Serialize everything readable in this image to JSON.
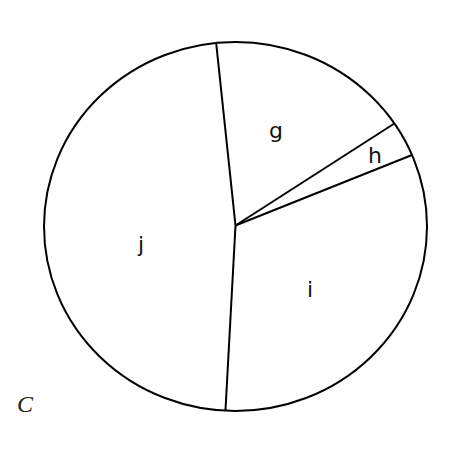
{
  "panel_label": "C",
  "chart_data": {
    "type": "pie",
    "title": "",
    "categories": [
      "g",
      "h",
      "i",
      "j"
    ],
    "values": [
      17.2,
      3.1,
      32.2,
      47.6
    ],
    "start_angle_deg": 354.2,
    "direction": "clockwise",
    "legend": "none",
    "labels_inside": true,
    "colors": {
      "fill": "#ffffff",
      "stroke": "#000000"
    }
  },
  "geometry": {
    "cx": 235.5,
    "cy": 226.5,
    "rx": 191.5,
    "ry": 184.5,
    "label_positions": {
      "g": [
        276,
        130
      ],
      "h": [
        375,
        155
      ],
      "i": [
        310,
        289
      ],
      "j": [
        141,
        244
      ]
    },
    "panel_label_position": [
      25,
      404
    ]
  }
}
